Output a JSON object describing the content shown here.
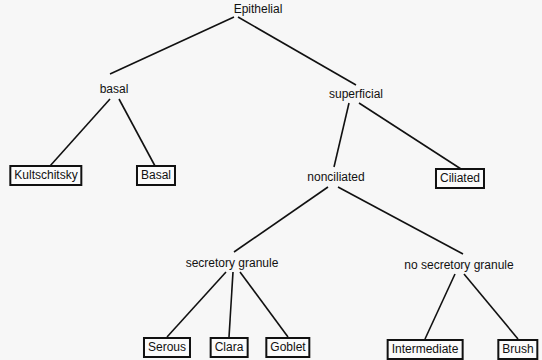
{
  "diagram": {
    "type": "tree",
    "root": "Epithelial",
    "nodes": {
      "epithelial": {
        "label": "Epithelial",
        "kind": "category"
      },
      "basal": {
        "label": "basal",
        "kind": "category"
      },
      "superficial": {
        "label": "superficial",
        "kind": "category"
      },
      "kultschitsky": {
        "label": "Kultschitsky",
        "kind": "cell-type"
      },
      "basal_cell": {
        "label": "Basal",
        "kind": "cell-type"
      },
      "nonciliated": {
        "label": "nonciliated",
        "kind": "category"
      },
      "ciliated": {
        "label": "Ciliated",
        "kind": "cell-type"
      },
      "secretory_granule": {
        "label": "secretory granule",
        "kind": "category"
      },
      "no_secretory_granule": {
        "label": "no secretory granule",
        "kind": "category"
      },
      "serous": {
        "label": "Serous",
        "kind": "cell-type"
      },
      "clara": {
        "label": "Clara",
        "kind": "cell-type"
      },
      "goblet": {
        "label": "Goblet",
        "kind": "cell-type"
      },
      "intermediate": {
        "label": "Intermediate",
        "kind": "cell-type"
      },
      "brush": {
        "label": "Brush",
        "kind": "cell-type"
      }
    },
    "edges": [
      [
        "Epithelial",
        "basal"
      ],
      [
        "Epithelial",
        "superficial"
      ],
      [
        "basal",
        "Kultschitsky"
      ],
      [
        "basal",
        "Basal"
      ],
      [
        "superficial",
        "nonciliated"
      ],
      [
        "superficial",
        "Ciliated"
      ],
      [
        "nonciliated",
        "secretory granule"
      ],
      [
        "nonciliated",
        "no secretory granule"
      ],
      [
        "secretory granule",
        "Serous"
      ],
      [
        "secretory granule",
        "Clara"
      ],
      [
        "secretory granule",
        "Goblet"
      ],
      [
        "no secretory granule",
        "Intermediate"
      ],
      [
        "no secretory granule",
        "Brush"
      ]
    ]
  }
}
